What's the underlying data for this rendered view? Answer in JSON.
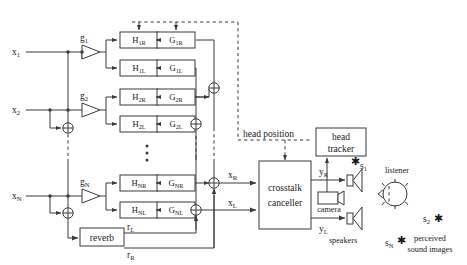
{
  "figure": {
    "type": "signal-flow-diagram"
  },
  "inputs": [
    {
      "id": "x1",
      "label": "x",
      "sub": "1",
      "gain": "g",
      "gain_sub": "1"
    },
    {
      "id": "x2",
      "label": "x",
      "sub": "2",
      "gain": "g",
      "gain_sub": "2"
    },
    {
      "id": "xN",
      "label": "x",
      "sub": "N",
      "gain": "g",
      "gain_sub": "N"
    }
  ],
  "filter_rows": [
    {
      "h": "H",
      "h_sub": "1R",
      "g": "G",
      "g_sub": "1R"
    },
    {
      "h": "H",
      "h_sub": "1L",
      "g": "G",
      "g_sub": "1L"
    },
    {
      "h": "H",
      "h_sub": "2R",
      "g": "G",
      "g_sub": "2R"
    },
    {
      "h": "H",
      "h_sub": "2L",
      "g": "G",
      "g_sub": "2L"
    },
    {
      "h": "H",
      "h_sub": "NR",
      "g": "G",
      "g_sub": "NR"
    },
    {
      "h": "H",
      "h_sub": "NL",
      "g": "G",
      "g_sub": "NL"
    }
  ],
  "blocks": {
    "reverb": "reverb",
    "crosstalk_line1": "crosstalk",
    "crosstalk_line2": "canceller",
    "head_tracker_line1": "head",
    "head_tracker_line2": "tracker"
  },
  "signals": {
    "reverb_left": "r",
    "reverb_left_sub": "L",
    "reverb_right": "r",
    "reverb_right_sub": "R",
    "xr": "x",
    "xr_sub": "R",
    "xl": "x",
    "xl_sub": "L",
    "yr": "y",
    "yr_sub": "R",
    "yl": "y",
    "yl_sub": "L"
  },
  "annotations": {
    "head_position": "head position",
    "camera": "camera",
    "speakers": "speakers",
    "listener": "listener",
    "perceived_line1": "perceived",
    "perceived_line2": "sound images"
  },
  "sources": [
    {
      "label": "s",
      "sub": "1"
    },
    {
      "label": "s",
      "sub": "2"
    },
    {
      "label": "s",
      "sub": "N"
    }
  ],
  "ellipsis": "⋮",
  "colors": {
    "stroke": "#3a3a3a",
    "text": "#1a1a1a",
    "background": "#ffffff"
  }
}
